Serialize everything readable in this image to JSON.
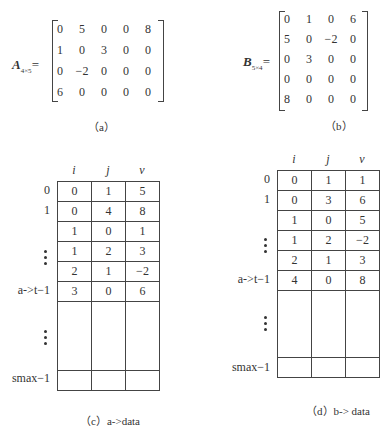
{
  "figure_a": {
    "label_letter": "A",
    "label_sub": "4×5",
    "equals": "=",
    "rows": [
      [
        "0",
        "5",
        "0",
        "0",
        "8"
      ],
      [
        "1",
        "0",
        "3",
        "0",
        "0"
      ],
      [
        "0",
        "−2",
        "0",
        "0",
        "0"
      ],
      [
        "6",
        "0",
        "0",
        "0",
        "0"
      ]
    ],
    "caption": "（a）"
  },
  "figure_b": {
    "label_letter": "B",
    "label_sub": "5×4",
    "equals": "=",
    "rows": [
      [
        "0",
        "1",
        "0",
        "6"
      ],
      [
        "5",
        "0",
        "−2",
        "0"
      ],
      [
        "0",
        "3",
        "0",
        "0"
      ],
      [
        "0",
        "0",
        "0",
        "0"
      ],
      [
        "8",
        "0",
        "0",
        "0"
      ]
    ],
    "caption": "（b）"
  },
  "figure_c": {
    "headers": [
      "i",
      "j",
      "v"
    ],
    "index_labels": {
      "r0": "0",
      "r1": "1",
      "last": "a->t−1",
      "max": "smax−1"
    },
    "rows": [
      [
        "0",
        "1",
        "5"
      ],
      [
        "0",
        "4",
        "8"
      ],
      [
        "1",
        "0",
        "1"
      ],
      [
        "1",
        "2",
        "3"
      ],
      [
        "2",
        "1",
        "−2"
      ],
      [
        "3",
        "0",
        "6"
      ]
    ],
    "caption": "（c）a->data"
  },
  "figure_d": {
    "headers": [
      "i",
      "j",
      "v"
    ],
    "index_labels": {
      "r0": "0",
      "r1": "1",
      "last": "a->t−1",
      "max": "smax−1"
    },
    "rows": [
      [
        "0",
        "1",
        "1"
      ],
      [
        "0",
        "3",
        "6"
      ],
      [
        "1",
        "0",
        "5"
      ],
      [
        "1",
        "2",
        "−2"
      ],
      [
        "2",
        "1",
        "3"
      ],
      [
        "4",
        "0",
        "8"
      ]
    ],
    "caption": "（d）b-> data"
  }
}
